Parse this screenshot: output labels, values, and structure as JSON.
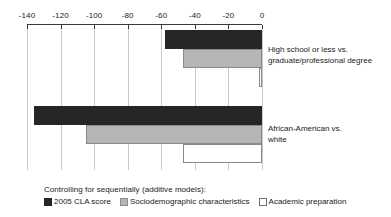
{
  "chart_data": {
    "type": "bar",
    "orientation": "horizontal",
    "title": "",
    "xlabel": "",
    "ylabel": "",
    "xlim": [
      -140,
      0
    ],
    "xticks": [
      -140,
      -120,
      -100,
      -80,
      -60,
      -40,
      -20,
      0
    ],
    "xtick_labels": [
      "-140",
      "-120",
      "-100",
      "-80",
      "-60",
      "-40",
      "-20",
      "0"
    ],
    "grid": true,
    "legend_position": "bottom-left",
    "legend_title": "Controlling for sequentially (additive models):",
    "categories": [
      "High school or less vs. graduate/professional degree",
      "African-American vs. white"
    ],
    "series": [
      {
        "name": "2005 CLA score",
        "color": "#262626",
        "values": [
          -58,
          -136
        ]
      },
      {
        "name": "Sociodemographic characteristics",
        "color": "#b5b5b5",
        "values": [
          -47,
          -105
        ]
      },
      {
        "name": "Academic preparation",
        "color": "#ffffff",
        "values": [
          -2,
          -47
        ]
      }
    ]
  },
  "axis": {
    "ticks": [
      {
        "value": -140,
        "label": "-140"
      },
      {
        "value": -120,
        "label": "-120"
      },
      {
        "value": -100,
        "label": "-100"
      },
      {
        "value": -80,
        "label": "-80"
      },
      {
        "value": -60,
        "label": "-60"
      },
      {
        "value": -40,
        "label": "-40"
      },
      {
        "value": -20,
        "label": "-20"
      },
      {
        "value": 0,
        "label": "0"
      }
    ]
  },
  "groups": [
    {
      "label": "High school or less vs.\ngraduate/professional degree",
      "bars": [
        {
          "series": "2005 CLA score",
          "value": -58,
          "style": "dark"
        },
        {
          "series": "Sociodemographic characteristics",
          "value": -47,
          "style": "gray"
        },
        {
          "series": "Academic preparation",
          "value": -2,
          "style": "white"
        }
      ]
    },
    {
      "label": "African-American vs.\nwhite",
      "bars": [
        {
          "series": "2005 CLA score",
          "value": -136,
          "style": "dark"
        },
        {
          "series": "Sociodemographic characteristics",
          "value": -105,
          "style": "gray"
        },
        {
          "series": "Academic preparation",
          "value": -47,
          "style": "white"
        }
      ]
    }
  ],
  "legend": {
    "title": "Controlling for sequentially (additive models):",
    "items": [
      {
        "label": "2005 CLA score",
        "style": "dark"
      },
      {
        "label": "Sociodemographic characteristics",
        "style": "gray"
      },
      {
        "label": "Academic preparation",
        "style": "white"
      }
    ]
  }
}
